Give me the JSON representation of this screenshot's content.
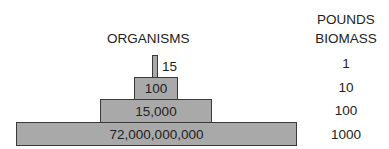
{
  "diagram": {
    "type": "pyramid of numbers",
    "organisms_header": "ORGANISMS",
    "biomass_header_line1": "POUNDS",
    "biomass_header_line2": "BIOMASS",
    "levels": [
      {
        "organisms": "15",
        "biomass": "1"
      },
      {
        "organisms": "100",
        "biomass": "10"
      },
      {
        "organisms": "15,000",
        "biomass": "100"
      },
      {
        "organisms": "72,000,000,000",
        "biomass": "1000"
      }
    ],
    "colors": {
      "box_fill": "#a9a9a9",
      "box_border": "#3a3a3a",
      "text": "#222222"
    }
  }
}
